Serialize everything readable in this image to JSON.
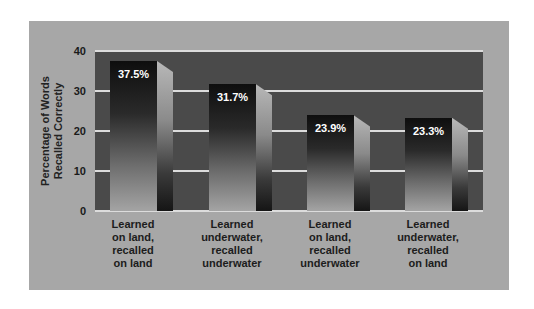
{
  "chart_data": {
    "type": "bar",
    "title": "",
    "xlabel": "",
    "ylabel": "Percentage of Words Recalled Correctly",
    "ylabel_lines": [
      "Percentage of Words",
      "Recalled Correctly"
    ],
    "ylim": [
      0,
      40
    ],
    "yticks": [
      "0",
      "10",
      "20",
      "30",
      "40"
    ],
    "grid": true,
    "legend": null,
    "categories": [
      "Learned on land, recalled on land",
      "Learned underwater, recalled underwater",
      "Learned on land, recalled underwater",
      "Learned underwater, recalled on land"
    ],
    "category_lines": [
      [
        "Learned",
        "on land,",
        "recalled",
        "on land"
      ],
      [
        "Learned",
        "underwater,",
        "recalled",
        "underwater"
      ],
      [
        "Learned",
        "on land,",
        "recalled",
        "underwater"
      ],
      [
        "Learned",
        "underwater,",
        "recalled",
        "on land"
      ]
    ],
    "values": [
      37.5,
      31.7,
      23.9,
      23.3
    ],
    "value_labels": [
      "37.5%",
      "31.7%",
      "23.9%",
      "23.3%"
    ]
  },
  "colors": {
    "panel_background": "#a7a7a7",
    "plot_background": "#4a4a4a",
    "gridline": "#dcdcdc",
    "bar_top": "#0e0e0e",
    "bar_bottom": "#a4a4a4",
    "value_label": "#ffffff"
  }
}
